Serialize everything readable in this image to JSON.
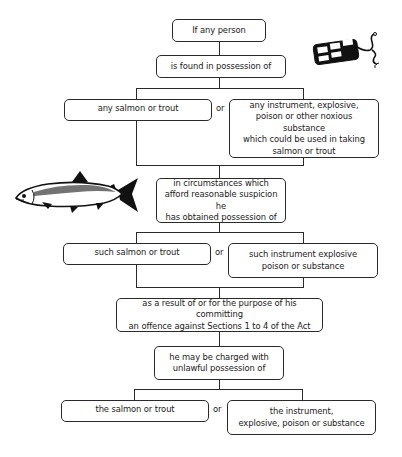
{
  "diagram": {
    "type": "legal-flowchart",
    "nodes": {
      "start": "If any person",
      "found": "is found in possession of",
      "any_fish": "any salmon or trout",
      "any_instrument": "any instrument, explosive,\npoison or other noxious substance\nwhich could be used in taking\nsalmon or trout",
      "circumstances": "in circumstances which\nafford reasonable suspicion he\nhas obtained possession of",
      "such_fish": "such salmon or trout",
      "such_instrument": "such instrument explosive\npoison or substance",
      "purpose": "as a result of or for the purpose of his committing\nan offence against Sections 1 to 4 of the Act",
      "charged": "he may be charged with\nunlawful possession of",
      "the_fish": "the salmon or trout",
      "the_instrument": "the instrument,\nexplosive, poison or substance"
    },
    "connector_label": "or",
    "edges": [
      [
        "start",
        "found"
      ],
      [
        "found",
        "any_fish"
      ],
      [
        "found",
        "any_instrument"
      ],
      [
        "any_fish",
        "circumstances"
      ],
      [
        "any_instrument",
        "circumstances"
      ],
      [
        "circumstances",
        "such_fish"
      ],
      [
        "circumstances",
        "such_instrument"
      ],
      [
        "such_fish",
        "purpose"
      ],
      [
        "such_instrument",
        "purpose"
      ],
      [
        "purpose",
        "charged"
      ],
      [
        "charged",
        "the_fish"
      ],
      [
        "charged",
        "the_instrument"
      ]
    ],
    "illustrations": [
      "dynamite-icon",
      "salmon-fish-icon"
    ]
  }
}
